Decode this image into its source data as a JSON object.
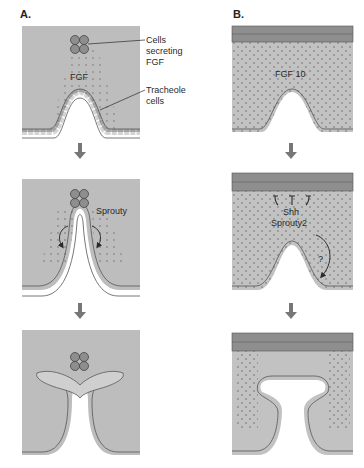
{
  "figure": {
    "panels": [
      {
        "id": "A",
        "label": "A.",
        "stages": [
          {
            "texts": {
              "signal": "FGF",
              "callout_1": "Cells",
              "callout_2": "secreting",
              "callout_3": "FGF",
              "callout_4": "Tracheole",
              "callout_5": "cells"
            }
          },
          {
            "texts": {
              "signal": "Sprouty"
            }
          },
          {
            "texts": {}
          }
        ]
      },
      {
        "id": "B",
        "label": "B.",
        "stages": [
          {
            "texts": {
              "signal": "FGF 10"
            }
          },
          {
            "texts": {
              "inhibitor_1": "Shh",
              "inhibitor_2": "Sprouty2",
              "unknown": "?"
            }
          },
          {
            "texts": {}
          }
        ]
      }
    ],
    "colors": {
      "tissue": "#bdbdbd",
      "dots": "#8a8a8a",
      "cell_fill": "#f2f2f2",
      "cell_stroke": "#555555",
      "secreting_cell": "#8e8e8e",
      "arrow": "#777777",
      "text": "#2a2a2a"
    }
  }
}
